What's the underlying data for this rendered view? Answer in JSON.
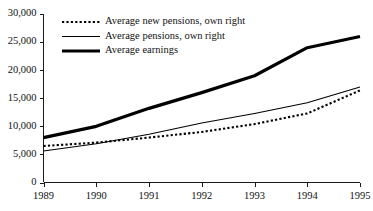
{
  "chart_data": {
    "type": "line",
    "title": "",
    "subtitle": "",
    "xlabel": "",
    "ylabel": "",
    "x": [
      1989,
      1990,
      1991,
      1992,
      1993,
      1994,
      1995
    ],
    "categories": [
      "1989",
      "1990",
      "1991",
      "1992",
      "1993",
      "1994",
      "1995"
    ],
    "xlim": [
      1989,
      1995
    ],
    "ylim": [
      0,
      30000
    ],
    "yticks": [
      0,
      5000,
      10000,
      15000,
      20000,
      25000,
      30000
    ],
    "ytick_labels": [
      "0",
      "5,000",
      "10,000",
      "15,000",
      "20,000",
      "25,000",
      "30,000"
    ],
    "xticks": [
      1989,
      1990,
      1991,
      1992,
      1993,
      1994,
      1995
    ],
    "xtick_labels": [
      "1989",
      "1990",
      "1991",
      "1992",
      "1993",
      "1994",
      "1995"
    ],
    "grid": false,
    "legend_position": "top-left",
    "series": [
      {
        "name": "Average new pensions, own right",
        "style": "dotted",
        "color": "#000000",
        "width": 2.1,
        "dash": "2.2,2.2",
        "values": [
          6500,
          7100,
          8000,
          9000,
          10400,
          12300,
          16400
        ]
      },
      {
        "name": "Average pensions, own right",
        "style": "solid-thin",
        "color": "#000000",
        "width": 1.1,
        "dash": "",
        "values": [
          5600,
          6900,
          8600,
          10600,
          12300,
          14200,
          17000
        ]
      },
      {
        "name": "Average earnings",
        "style": "solid-thick",
        "color": "#000000",
        "width": 3.2,
        "dash": "",
        "values": [
          8000,
          10000,
          13200,
          16000,
          19000,
          24000,
          26000
        ]
      }
    ]
  },
  "legend": {
    "entries": [
      {
        "label": "Average new pensions, own right"
      },
      {
        "label": "Average pensions, own right"
      },
      {
        "label": "Average earnings"
      }
    ]
  },
  "colors": {
    "ink": "#000000",
    "axis": "#1a1a1a",
    "background": "#ffffff"
  }
}
